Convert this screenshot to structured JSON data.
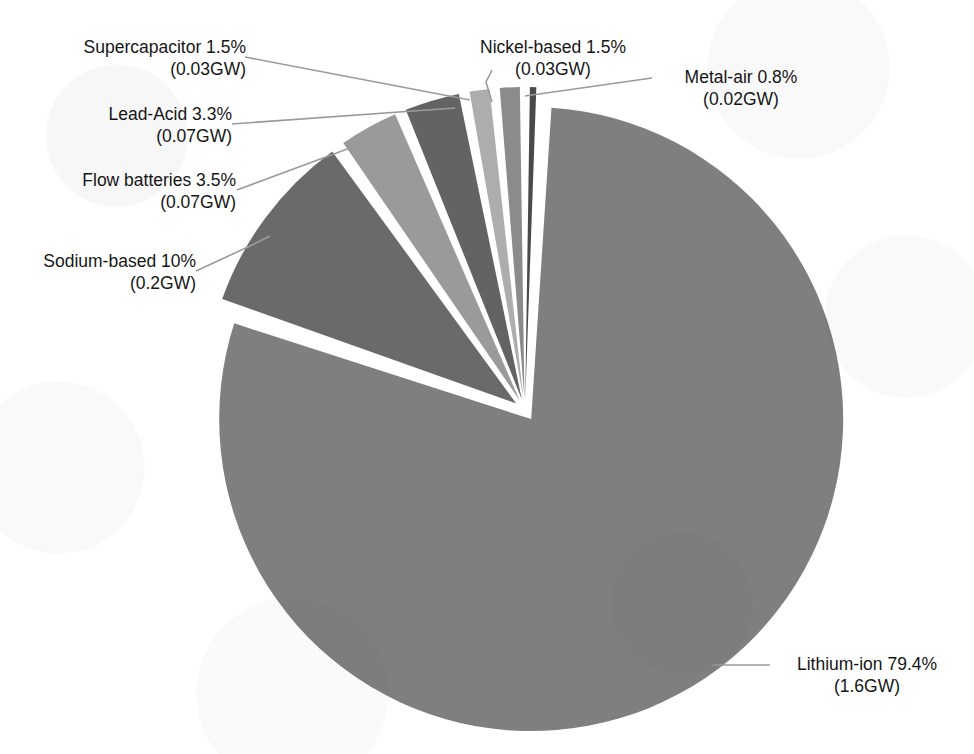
{
  "chart_data": {
    "type": "pie",
    "title": "",
    "subtitle": "",
    "xlabel": "",
    "ylabel": "",
    "legend_position": "none",
    "grid": false,
    "value_unit": "GW",
    "categories": [
      "Lithium-ion",
      "Sodium-based",
      "Flow batteries",
      "Lead-Acid",
      "Supercapacitor",
      "Nickel-based",
      "Metal-air"
    ],
    "values": [
      79.4,
      10,
      3.5,
      3.3,
      1.5,
      1.5,
      0.8
    ],
    "absolute_values": [
      1.6,
      0.2,
      0.07,
      0.07,
      0.03,
      0.03,
      0.02
    ],
    "slice_colors": [
      "#7f7f7f",
      "#6a6a6a",
      "#9a9a9a",
      "#636363",
      "#adadad",
      "#8b8b8b",
      "#4a4a4a"
    ],
    "slices": [
      {
        "name": "Lithium-ion",
        "percent": "79.4%",
        "value": "1.6GW",
        "color": "#7f7f7f"
      },
      {
        "name": "Sodium-based",
        "percent": "10%",
        "value": "0.2GW",
        "color": "#6a6a6a"
      },
      {
        "name": "Flow batteries",
        "percent": "3.5%",
        "value": "0.07GW",
        "color": "#9a9a9a"
      },
      {
        "name": "Lead-Acid",
        "percent": "3.3%",
        "value": "0.07GW",
        "color": "#636363"
      },
      {
        "name": "Supercapacitor",
        "percent": "1.5%",
        "value": "0.03GW",
        "color": "#adadad"
      },
      {
        "name": "Nickel-based",
        "percent": "1.5%",
        "value": "0.03GW",
        "color": "#8b8b8b"
      },
      {
        "name": "Metal-air",
        "percent": "0.8%",
        "value": "0.02GW",
        "color": "#4a4a4a"
      }
    ]
  },
  "labels": {
    "supercapacitor": {
      "line1": "Supercapacitor 1.5%",
      "line2": "(0.03GW)"
    },
    "lead_acid": {
      "line1": "Lead-Acid 3.3%",
      "line2": "(0.07GW)"
    },
    "flow_batteries": {
      "line1": "Flow batteries 3.5%",
      "line2": "(0.07GW)"
    },
    "sodium_based": {
      "line1": "Sodium-based 10%",
      "line2": "(0.2GW)"
    },
    "nickel_based": {
      "line1": "Nickel-based 1.5%",
      "line2": "(0.03GW)"
    },
    "metal_air": {
      "line1": "Metal-air 0.8%",
      "line2": "(0.02GW)"
    },
    "lithium_ion": {
      "line1": "Lithium-ion 79.4%",
      "line2": "(1.6GW)"
    }
  },
  "style": {
    "background": "#ffffff",
    "leader_line_color": "#9a9a9a",
    "slice_gap_color": "#ffffff",
    "text_color": "#161616"
  }
}
